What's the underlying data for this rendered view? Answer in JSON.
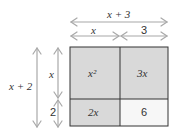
{
  "diagram": {
    "type": "area-model",
    "top_outer_label": "x + 3",
    "top_inner_left_label": "x",
    "top_inner_right_label": "3",
    "left_outer_label": "x + 2",
    "left_inner_top_label": "x",
    "left_inner_bottom_label": "2",
    "cells": [
      {
        "label": "x²",
        "fill": "#d9d9d9"
      },
      {
        "label": "3x",
        "fill": "#d9d9d9"
      },
      {
        "label": "2x",
        "fill": "#d9d9d9"
      },
      {
        "label": "6",
        "fill": "#f7f7f7"
      }
    ],
    "arrow_color": "#a8a8a8",
    "border_color": "#333333"
  }
}
